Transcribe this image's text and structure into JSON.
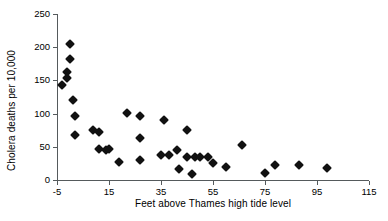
{
  "chart_data": {
    "type": "scatter",
    "title": "",
    "xlabel": "Feet above Thames high tide level",
    "ylabel": "Cholera deaths per 10,000",
    "xlim": [
      -5,
      115
    ],
    "ylim": [
      0,
      250
    ],
    "xticks": [
      -5,
      15,
      35,
      55,
      75,
      95,
      115
    ],
    "yticks": [
      0,
      50,
      100,
      150,
      200,
      250
    ],
    "xtick_labels": [
      "-5",
      "15",
      "35",
      "55",
      "75",
      "95",
      "115"
    ],
    "ytick_labels": [
      "0",
      "50",
      "100",
      "150",
      "200",
      "250"
    ],
    "grid": false,
    "legend": false,
    "marker": "diamond",
    "marker_color": "#111111",
    "axis_color": "#555a5c",
    "points": [
      {
        "x": -3,
        "y": 143
      },
      {
        "x": -1,
        "y": 163
      },
      {
        "x": -1,
        "y": 153
      },
      {
        "x": 0,
        "y": 182
      },
      {
        "x": 0,
        "y": 205
      },
      {
        "x": 1,
        "y": 121
      },
      {
        "x": 2,
        "y": 97
      },
      {
        "x": 2,
        "y": 68
      },
      {
        "x": 9,
        "y": 75
      },
      {
        "x": 11,
        "y": 72
      },
      {
        "x": 11,
        "y": 46
      },
      {
        "x": 14,
        "y": 45
      },
      {
        "x": 15,
        "y": 47
      },
      {
        "x": 19,
        "y": 27
      },
      {
        "x": 22,
        "y": 101
      },
      {
        "x": 27,
        "y": 96
      },
      {
        "x": 27,
        "y": 64
      },
      {
        "x": 27,
        "y": 30
      },
      {
        "x": 35,
        "y": 37
      },
      {
        "x": 36,
        "y": 90
      },
      {
        "x": 38,
        "y": 38
      },
      {
        "x": 41,
        "y": 45
      },
      {
        "x": 42,
        "y": 16
      },
      {
        "x": 45,
        "y": 75
      },
      {
        "x": 45,
        "y": 34
      },
      {
        "x": 47,
        "y": 9
      },
      {
        "x": 48,
        "y": 35
      },
      {
        "x": 50,
        "y": 34
      },
      {
        "x": 53,
        "y": 35
      },
      {
        "x": 55,
        "y": 26
      },
      {
        "x": 60,
        "y": 20
      },
      {
        "x": 66,
        "y": 53
      },
      {
        "x": 75,
        "y": 10
      },
      {
        "x": 79,
        "y": 22
      },
      {
        "x": 88,
        "y": 22
      },
      {
        "x": 99,
        "y": 18
      }
    ]
  }
}
